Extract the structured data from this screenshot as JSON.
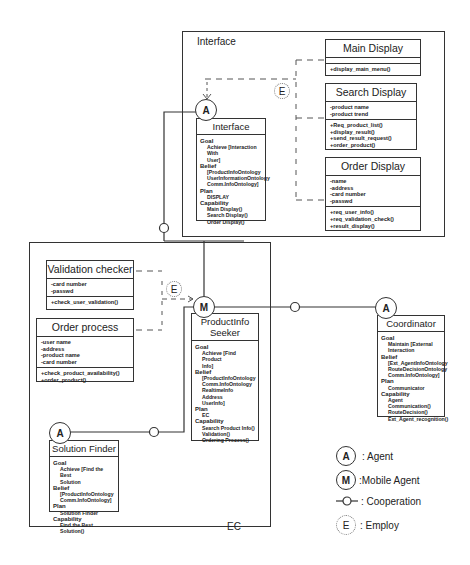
{
  "interface_frame": {
    "label": "Interface"
  },
  "ec_frame": {
    "label": "EC"
  },
  "classes": {
    "main_display": {
      "title": "Main Display",
      "attributes": [],
      "methods": [
        "+display_main_menu()"
      ]
    },
    "search_display": {
      "title": "Search Display",
      "attributes": [
        "-product name",
        "-product trend"
      ],
      "methods": [
        "+Req_product_list()",
        "+display_result()",
        "+send_result_request()",
        "+order_product()"
      ]
    },
    "order_display": {
      "title": "Order Display",
      "attributes": [
        "-name",
        "-address",
        "-card number",
        "-passwd"
      ],
      "methods": [
        "+req_user_info()",
        "+req_validation_check()",
        "+result_display()"
      ]
    },
    "validation_checker": {
      "title": "Validation checker",
      "attributes": [
        "-card number",
        "-passwd"
      ],
      "methods": [
        "+check_user_validation()"
      ]
    },
    "order_process": {
      "title": "Order process",
      "attributes": [
        "-user name",
        "-address",
        "-product name",
        "-card number"
      ],
      "methods": [
        "+check_product_availability()",
        "+order_product()"
      ]
    }
  },
  "agents": {
    "interface": {
      "marker": "A",
      "title": "Interface",
      "goal_label": "Goal",
      "goal": [
        "Achieve [Interaction With",
        "User]"
      ],
      "belief_label": "Belief",
      "belief": [
        "[ProductInfoOntology",
        "UserInformationOntology",
        "Comm.InfoOntology]"
      ],
      "plan_label": "Plan",
      "plan": [
        "DISPLAY"
      ],
      "capability_label": "Capability",
      "capability": [
        "Main Display()",
        "Search Display()",
        "Order Display()"
      ]
    },
    "productinfo_seeker": {
      "marker": "M",
      "title_line1": "ProductInfo",
      "title_line2": "Seeker",
      "goal_label": "Goal",
      "goal": [
        "Achieve [Find Product",
        "Info]"
      ],
      "belief_label": "Belief",
      "belief": [
        "[ProductInfoOntology",
        "Comm.InfoOntology",
        "RealtimeInfo",
        "Address",
        "UserInfo]"
      ],
      "plan_label": "Plan",
      "plan": [
        "EC"
      ],
      "capability_label": "Capability",
      "capability": [
        "Search Product Info()",
        "Validation()",
        "Ordering Process()"
      ]
    },
    "coordinator": {
      "marker": "A",
      "title": "Coordinator",
      "goal_label": "Goal",
      "goal": [
        "Maintain [External",
        "Interaction"
      ],
      "belief_label": "Belief",
      "belief": [
        "[Ext_AgentInfoOntology",
        "RouteDecisionOntology",
        "Comm.InfoOntology]"
      ],
      "plan_label": "Plan",
      "plan": [
        "Communicator"
      ],
      "capability_label": "Capability",
      "capability": [
        "Agent Communication()",
        "RouteDecision()",
        "Ext_Agent_recognition()"
      ]
    },
    "solution_finder": {
      "marker": "A",
      "title": "Solution Finder",
      "goal_label": "Goal",
      "goal": [
        "Achieve [Find the Best",
        "Solution"
      ],
      "belief_label": "Belief",
      "belief": [
        "[ProductInfoOntology",
        "Comm.InfoOntology]"
      ],
      "plan_label": "Plan",
      "plan": [
        "Solution Finder"
      ],
      "capability_label": "Capability",
      "capability": [
        "Find the Best Solution()"
      ]
    }
  },
  "employ_markers": {
    "top": "E",
    "middle": "E"
  },
  "legend": {
    "agent": {
      "symbol": "A",
      "label": ": Agent"
    },
    "mobile_agent": {
      "symbol": "M",
      "label": ":Mobile Agent"
    },
    "cooperation": {
      "label": ": Cooperation"
    },
    "employ": {
      "symbol": "E",
      "label": ": Employ"
    }
  }
}
